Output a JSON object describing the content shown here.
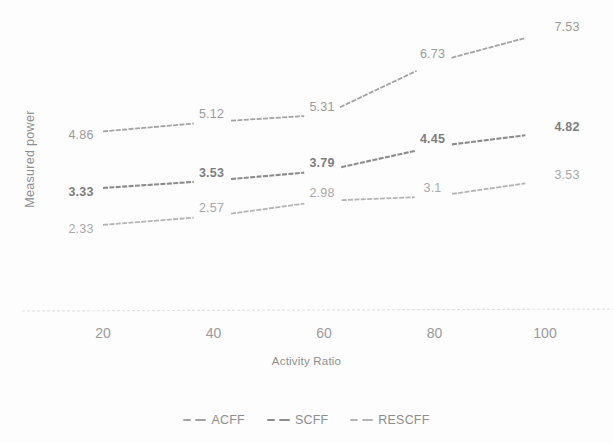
{
  "chart_data": {
    "type": "line",
    "title": "",
    "xlabel": "Activity Ratio",
    "ylabel": "Measured power",
    "x": [
      20,
      40,
      60,
      80,
      100
    ],
    "xticklabels": [
      "20",
      "40",
      "60",
      "80",
      "100"
    ],
    "xlim": [
      10,
      110
    ],
    "ylim": [
      0,
      8.2
    ],
    "grid": false,
    "legend_position": "bottom",
    "series": [
      {
        "name": "ACFF",
        "values": [
          4.86,
          5.12,
          5.31,
          6.73,
          7.53
        ],
        "labels": [
          "4.86",
          "5.12",
          "5.31",
          "6.73",
          "7.53"
        ],
        "color": "#a3a3a3",
        "style": "dashed"
      },
      {
        "name": "SCFF",
        "values": [
          3.33,
          3.53,
          3.79,
          4.45,
          4.82
        ],
        "labels": [
          "3.33",
          "3.53",
          "3.79",
          "4.45",
          "4.82"
        ],
        "color": "#8c8c8c",
        "style": "dashed"
      },
      {
        "name": "RESCFF",
        "values": [
          2.33,
          2.57,
          2.98,
          3.1,
          3.53
        ],
        "labels": [
          "2.33",
          "2.57",
          "2.98",
          "3.1",
          "3.53"
        ],
        "color": "#b4b4b4",
        "style": "dashed"
      }
    ],
    "axis_color": "#dcdcdc"
  },
  "axes": {
    "ylabel": "Measured power",
    "xlabel": "Activity Ratio",
    "xticks": [
      "20",
      "40",
      "60",
      "80",
      "100"
    ]
  },
  "legend": {
    "items": [
      {
        "label": "ACFF",
        "color": "#a3a3a3"
      },
      {
        "label": "SCFF",
        "color": "#8c8c8c"
      },
      {
        "label": "RESCFF",
        "color": "#b4b4b4"
      }
    ]
  },
  "labels": {
    "acff": [
      "4.86",
      "5.12",
      "5.31",
      "6.73",
      "7.53"
    ],
    "scff": [
      "3.33",
      "3.53",
      "3.79",
      "4.45",
      "4.82"
    ],
    "rescff": [
      "2.33",
      "2.57",
      "2.98",
      "3.1",
      "3.53"
    ]
  }
}
